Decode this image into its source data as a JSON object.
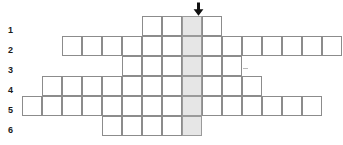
{
  "puzzle": {
    "type": "crossword-grid",
    "cell_size": 20,
    "grid_origin": {
      "x": 22,
      "y": 16
    },
    "highlight_column_index": 8,
    "highlight_color": "#e6e6e6",
    "border_color": "#8c8c8c",
    "background_color": "#ffffff",
    "row_number_color": "#1a1a1a",
    "arrow": {
      "name": "down-arrow-marker",
      "glyph": "down-arrow",
      "color": "#111111",
      "x": 190,
      "y": 2,
      "points_to_column_index": 8
    },
    "rows": [
      {
        "number": "1",
        "label_x": 8,
        "label_y": 26,
        "start_column_index": 6,
        "cell_count": 4,
        "y": 16,
        "highlight_position": 3
      },
      {
        "number": "2",
        "label_x": 8,
        "label_y": 46,
        "start_column_index": 2,
        "cell_count": 14,
        "y": 36,
        "highlight_position": 7
      },
      {
        "number": "3",
        "label_x": 8,
        "label_y": 66,
        "start_column_index": 5,
        "cell_count": 6,
        "y": 56,
        "highlight_position": 4
      },
      {
        "number": "4",
        "label_x": 8,
        "label_y": 86,
        "start_column_index": 1,
        "cell_count": 11,
        "y": 76,
        "highlight_position": 8
      },
      {
        "number": "5",
        "label_x": 8,
        "label_y": 106,
        "start_column_index": 0,
        "cell_count": 15,
        "y": 96,
        "highlight_position": 9
      },
      {
        "number": "6",
        "label_x": 8,
        "label_y": 126,
        "start_column_index": 4,
        "cell_count": 5,
        "y": 116,
        "highlight_position": 5
      }
    ],
    "stray_marks": [
      {
        "name": "faint-mark-row-3",
        "x": 243,
        "y": 68,
        "width": 5,
        "height": 1
      }
    ]
  }
}
